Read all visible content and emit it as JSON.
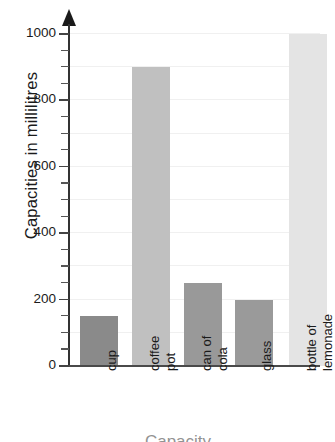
{
  "chart_data": {
    "type": "bar",
    "title": "",
    "xlabel": "Capacity",
    "ylabel": "Capacities in millilitres",
    "categories": [
      "cup",
      "coffee pot",
      "can of cola",
      "glass",
      "bottle of lemonade"
    ],
    "category_lines": [
      [
        "cup"
      ],
      [
        "coffee",
        "pot"
      ],
      [
        "can of",
        "cola"
      ],
      [
        "glass"
      ],
      [
        "bottle of",
        "lemonade"
      ]
    ],
    "values": [
      150,
      900,
      250,
      200,
      1000
    ],
    "ylim": [
      0,
      1050
    ],
    "ytick_labels": [
      "0",
      "200",
      "400",
      "600",
      "800",
      "1000"
    ],
    "ytick_values": [
      0,
      200,
      400,
      600,
      800,
      1000
    ],
    "minor_tick_step": 50,
    "gridline_step": 100,
    "grid": true,
    "legend": "none",
    "bar_colors": [
      "#8a8a8a",
      "#c0c0c0",
      "#999999",
      "#9a9a9a",
      "#e4e4e4"
    ]
  },
  "axis": {
    "y_title": "Capacities in millilitres",
    "x_title_partial": "Capacity"
  },
  "colors": {
    "background": "#ffffff",
    "axis": "#333333",
    "gridline": "#f0f0f0",
    "text": "#1b1b1b"
  }
}
